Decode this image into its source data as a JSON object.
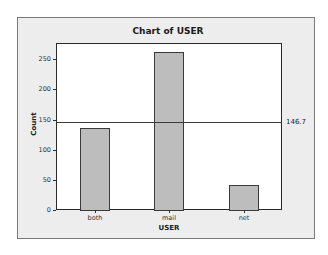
{
  "chart_data": {
    "type": "bar",
    "title": "Chart of USER",
    "xlabel": "USER",
    "ylabel": "Count",
    "categories": [
      "both",
      "mail",
      "net"
    ],
    "values": [
      136,
      262,
      42
    ],
    "ylim": [
      0,
      260
    ],
    "yticks": [
      0,
      50,
      100,
      150,
      200,
      250
    ],
    "reference_line": {
      "value": 146.7,
      "label": "146.7"
    },
    "grid": false,
    "legend": null
  },
  "labels": {
    "title": "Chart of USER",
    "xlabel": "USER",
    "ylabel": "Count",
    "ref_label": "146.7",
    "yticks": [
      "0",
      "50",
      "100",
      "150",
      "200",
      "250"
    ],
    "xticks": [
      "both",
      "mail",
      "net"
    ]
  },
  "colors": {
    "bar_fill": "#bdbdbd",
    "bar_edge": "#3a3a3a",
    "outer_background": "#ededed",
    "plot_background": "#ffffff"
  }
}
